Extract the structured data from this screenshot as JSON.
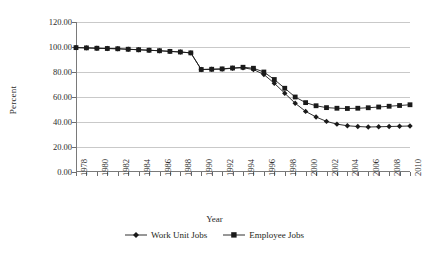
{
  "chart_data": {
    "type": "line",
    "title": "",
    "xlabel": "Year",
    "ylabel": "Percent",
    "ylim": [
      0,
      120
    ],
    "ytick_step": 20,
    "ytick_labels": [
      "120.00",
      "100.00",
      "80.00",
      "60.00",
      "40.00",
      "20.00",
      "0.00"
    ],
    "ytick_values": [
      120,
      100,
      80,
      60,
      40,
      20,
      0
    ],
    "xlim": [
      1978,
      2010
    ],
    "grid": true,
    "grid_axis": "y",
    "legend_position": "bottom",
    "x": [
      1978,
      1979,
      1980,
      1981,
      1982,
      1983,
      1984,
      1985,
      1986,
      1987,
      1988,
      1989,
      1990,
      1991,
      1992,
      1993,
      1994,
      1995,
      1996,
      1997,
      1998,
      1999,
      2000,
      2001,
      2002,
      2003,
      2004,
      2005,
      2006,
      2007,
      2008,
      2009,
      2010
    ],
    "xtick_labels": [
      "1978",
      "1980",
      "1982",
      "1984",
      "1986",
      "1988",
      "1990",
      "1992",
      "1994",
      "1996",
      "1998",
      "2000",
      "2002",
      "2004",
      "2006",
      "2008",
      "2010"
    ],
    "xtick_label_values": [
      1978,
      1980,
      1982,
      1984,
      1986,
      1988,
      1990,
      1992,
      1994,
      1996,
      1998,
      2000,
      2002,
      2004,
      2006,
      2008,
      2010
    ],
    "series": [
      {
        "name": "Work Unit Jobs",
        "marker": "diamond",
        "color": "#1a1a1a",
        "values": [
          99.5,
          99.3,
          99.0,
          98.8,
          98.6,
          98.2,
          97.8,
          97.4,
          97.0,
          96.5,
          96.0,
          95.3,
          82.0,
          82.2,
          82.3,
          83.0,
          83.4,
          82.0,
          78.0,
          71.0,
          63.0,
          55.0,
          48.5,
          44.0,
          40.5,
          38.3,
          37.0,
          36.4,
          36.0,
          36.2,
          36.4,
          36.6,
          36.8
        ]
      },
      {
        "name": "Employee Jobs",
        "marker": "square",
        "color": "#1a1a1a",
        "values": [
          99.5,
          99.3,
          99.0,
          98.8,
          98.6,
          98.2,
          97.8,
          97.4,
          97.0,
          96.5,
          96.0,
          95.3,
          82.0,
          82.2,
          82.5,
          83.2,
          83.8,
          83.0,
          80.0,
          74.0,
          67.0,
          60.0,
          55.5,
          53.0,
          51.5,
          51.0,
          50.8,
          51.0,
          51.4,
          52.0,
          52.6,
          53.2,
          53.8
        ]
      }
    ]
  },
  "legend": {
    "items": [
      {
        "label": "Work Unit Jobs",
        "marker": "diamond"
      },
      {
        "label": "Employee Jobs",
        "marker": "square"
      }
    ]
  }
}
